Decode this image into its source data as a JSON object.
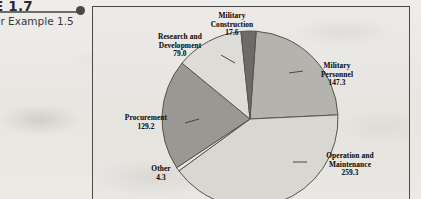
{
  "figure": {
    "title": "E 1.7",
    "subtitle": "or Example 1.5"
  },
  "chart_data": {
    "type": "pie",
    "title": "",
    "subtitle": "",
    "xlabel": "",
    "ylabel": "",
    "units": "billions of dollars",
    "total": 636.7,
    "legend": "none",
    "grid": false,
    "categories": [
      "Military Personnel",
      "Operation and Maintenance",
      "Other",
      "Procurement",
      "Research and Development",
      "Military Construction"
    ],
    "values": [
      147.3,
      259.3,
      4.3,
      129.2,
      79.0,
      17.6
    ],
    "slices": [
      {
        "label": "Military Personnel",
        "value": 147.3,
        "value_text": "147.3",
        "label_line1": "Military",
        "label_line2": "Personnel",
        "color": "#b5b3ae",
        "start_angle": 4,
        "end_angle": 87.3
      },
      {
        "label": "Operation and Maintenance",
        "value": 259.3,
        "value_text": "259.3",
        "label_line1": "Operation and",
        "label_line2": "Maintenance",
        "color": "#d9d7d2",
        "start_angle": 87.3,
        "end_angle": 233.9
      },
      {
        "label": "Other",
        "value": 4.3,
        "value_text": "4.3",
        "label_line1": "Other",
        "label_line2": "",
        "color": "#e9e7e3",
        "start_angle": 233.9,
        "end_angle": 236.4
      },
      {
        "label": "Procurement",
        "value": 129.2,
        "value_text": "129.2",
        "label_line1": "Procurement",
        "label_line2": "",
        "color": "#9a9893",
        "start_angle": 236.4,
        "end_angle": 309.4
      },
      {
        "label": "Research and Development",
        "value": 79.0,
        "value_text": "79.0",
        "label_line1": "Research and",
        "label_line2": "Development",
        "color": "#dedcd7",
        "start_angle": 309.4,
        "end_angle": 354.1
      },
      {
        "label": "Military Construction",
        "value": 17.6,
        "value_text": "17.6",
        "label_line1": "Military",
        "label_line2": "Construction",
        "color": "#6d6b67",
        "start_angle": 354.1,
        "end_angle": 364
      }
    ]
  },
  "labels": {
    "military_construction": "Military\nConstruction\n17.6",
    "research_development": "Research and\nDevelopment\n79.0",
    "military_personnel": "Military\nPersonnel\n147.3",
    "procurement": "Procurement\n129.2",
    "other": "Other\n4.3",
    "operation_maintenance": "Operation and\nMaintenance\n259.3"
  },
  "colors": {
    "panel_border": "#4b4a48",
    "slice_outline": "#56544f",
    "paper": "#eceae6",
    "text": "#161514"
  }
}
